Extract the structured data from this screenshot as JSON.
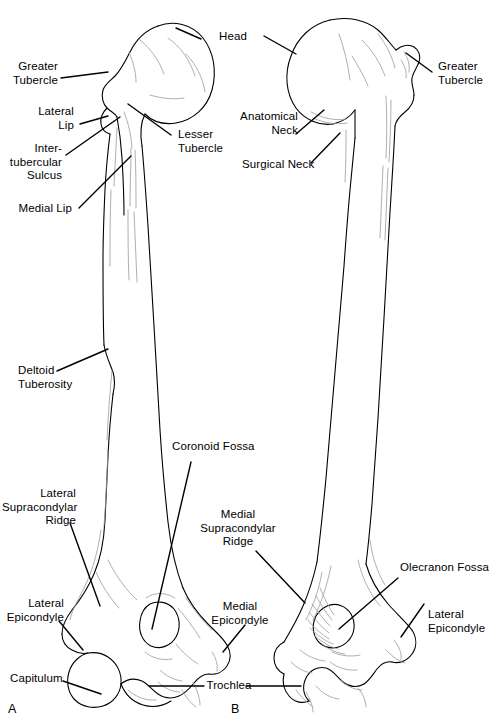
{
  "figure": {
    "background_color": "#ffffff",
    "line_color": "#000000",
    "detail_line_color": "#9a9a9a",
    "leader_color": "#000000",
    "width": 492,
    "height": 723
  },
  "panels": [
    {
      "letter": "A",
      "view": "anterior"
    },
    {
      "letter": "B",
      "view": "posterior"
    }
  ],
  "labels": {
    "greater_tubercle_left": "Greater\nTubercle",
    "lateral_lip": "Lateral\nLip",
    "intertubercular_sulcus": "Inter-\ntubercular\nSulcus",
    "medial_lip": "Medial Lip",
    "head": "Head",
    "lesser_tubercle": "Lesser\nTubercle",
    "anatomical_neck": "Anatomical\nNeck",
    "surgical_neck": "Surgical Neck",
    "greater_tubercle_right": "Greater\nTubercle",
    "deltoid_tuberosity": "Deltoid\nTuberosity",
    "coronoid_fossa": "Coronoid Fossa",
    "lateral_supracondylar_ridge": "Lateral\nSupracondylar\nRidge",
    "medial_supracondylar_ridge": "Medial\nSupracondylar\nRidge",
    "olecranon_fossa": "Olecranon Fossa",
    "lateral_epicondyle_left": "Lateral\nEpicondyle",
    "medial_epicondyle": "Medial\nEpicondyle",
    "lateral_epicondyle_right": "Lateral\nEpicondyle",
    "capitulum": "Capitulum",
    "trochlea": "Trochlea"
  }
}
